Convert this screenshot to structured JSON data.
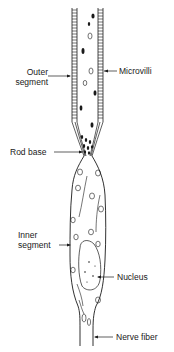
{
  "diagram": {
    "labels": {
      "outer_segment": "Outer\nsegment",
      "outer_segment_line1": "Outer",
      "outer_segment_line2": "segment",
      "microvilli": "Microvilli",
      "rod_base": "Rod base",
      "inner_segment_line1": "Inner",
      "inner_segment_line2": "segment",
      "nucleus": "Nucleus",
      "nerve_fiber": "Nerve fiber"
    },
    "colors": {
      "ink": "#1a1a1a",
      "background": "#ffffff"
    }
  }
}
